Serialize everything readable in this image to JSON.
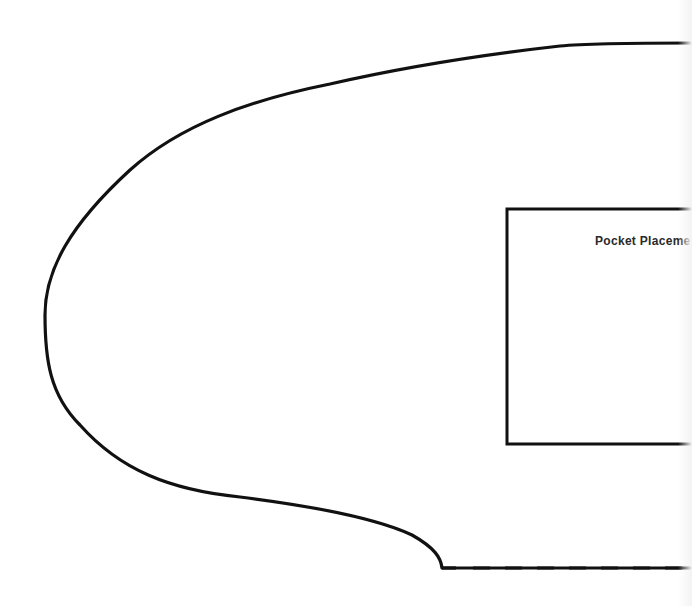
{
  "diagram": {
    "type": "sewing-pattern-piece",
    "outline": {
      "stroke": "#111111",
      "style": "solid"
    },
    "fold_line": {
      "stroke": "#111111",
      "style": "dashed"
    },
    "pocket": {
      "label": "Pocket Placement",
      "visible_label": "Pocket Placeme"
    }
  }
}
